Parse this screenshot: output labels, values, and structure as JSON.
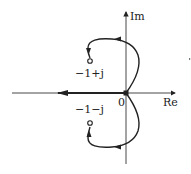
{
  "diagram": {
    "type": "root-locus",
    "axes": {
      "real_label": "Re",
      "imag_label": "Im",
      "origin_label": "0"
    },
    "zeros": [
      {
        "label": "−1+j",
        "re": -1,
        "im": 1
      },
      {
        "label": "−1−j",
        "re": -1,
        "im": -1
      }
    ],
    "poles": [
      {
        "label": "0",
        "re": 0,
        "im": 0
      }
    ],
    "branches": [
      {
        "name": "upper-branch",
        "from": "origin",
        "to": "-1+j",
        "direction": "arcs right then loops left into zero"
      },
      {
        "name": "lower-branch",
        "from": "origin",
        "to": "-1-j",
        "direction": "arcs right then loops left into zero"
      },
      {
        "name": "real-axis-branch",
        "from": "origin",
        "to": "-infinity",
        "direction": "leftward along negative real axis"
      }
    ],
    "colors": {
      "line": "#222222",
      "background": "#ffffff"
    }
  }
}
